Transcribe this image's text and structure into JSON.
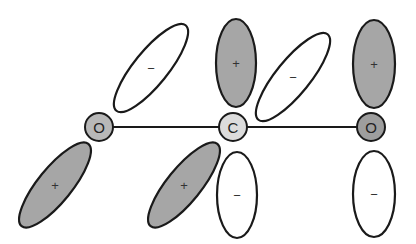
{
  "diagram": {
    "title": "",
    "colors": {
      "positive_lobe": "#a6a6a6",
      "negative_lobe": "#ffffff",
      "outline": "#1a1a1a",
      "atom_O_left": "#b8b8b8",
      "atom_C": "#dcdcdc",
      "atom_O_right": "#9e9e9e",
      "bond": "#1a1a1a"
    },
    "atoms": [
      {
        "id": "O1",
        "label": "O",
        "cx": 99,
        "cy": 127
      },
      {
        "id": "C",
        "label": "C",
        "cx": 233,
        "cy": 127
      },
      {
        "id": "O2",
        "label": "O",
        "cx": 371,
        "cy": 127
      }
    ],
    "bonds": [
      {
        "from": "O1",
        "to": "C"
      },
      {
        "from": "C",
        "to": "O2"
      }
    ],
    "lobes": [
      {
        "atom": "O1",
        "position": "upper",
        "sign": "−",
        "phase": "negative",
        "cx": 151,
        "cy": 68,
        "rx": 55,
        "ry": 17,
        "angle": -51
      },
      {
        "atom": "O1",
        "position": "lower",
        "sign": "+",
        "phase": "positive",
        "cx": 55,
        "cy": 185,
        "rx": 53,
        "ry": 17,
        "angle": -51
      },
      {
        "atom": "C",
        "position": "upper",
        "sign": "+",
        "phase": "positive",
        "cx": 236,
        "cy": 63,
        "rx": 20,
        "ry": 44,
        "angle": 0
      },
      {
        "atom": "C",
        "position": "lower",
        "sign": "−",
        "phase": "negative",
        "cx": 237,
        "cy": 195,
        "rx": 20,
        "ry": 43,
        "angle": 0
      },
      {
        "atom": "C",
        "position": "upper-right",
        "sign": "−",
        "phase": "negative",
        "cx": 293,
        "cy": 77,
        "rx": 55,
        "ry": 17,
        "angle": -51
      },
      {
        "atom": "C",
        "position": "lower-left",
        "sign": "+",
        "phase": "positive",
        "cx": 184,
        "cy": 185,
        "rx": 53,
        "ry": 17,
        "angle": -51
      },
      {
        "atom": "O2",
        "position": "upper",
        "sign": "+",
        "phase": "positive",
        "cx": 374,
        "cy": 64,
        "rx": 21,
        "ry": 44,
        "angle": 0
      },
      {
        "atom": "O2",
        "position": "lower",
        "sign": "−",
        "phase": "negative",
        "cx": 374,
        "cy": 194,
        "rx": 21,
        "ry": 43,
        "angle": 0
      }
    ]
  }
}
